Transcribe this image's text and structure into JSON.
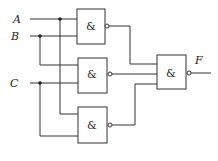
{
  "diagram": {
    "type": "logic-circuit",
    "inputs": [
      {
        "label": "A"
      },
      {
        "label": "B"
      },
      {
        "label": "C"
      }
    ],
    "output": {
      "label": "F"
    },
    "gates": [
      {
        "id": "g1",
        "symbol": "&",
        "type": "NAND",
        "inputs": [
          "A",
          "B"
        ]
      },
      {
        "id": "g2",
        "symbol": "&",
        "type": "NAND",
        "inputs": [
          "B",
          "C"
        ]
      },
      {
        "id": "g3",
        "symbol": "&",
        "type": "NAND",
        "inputs": [
          "A",
          "C"
        ]
      },
      {
        "id": "g4",
        "symbol": "&",
        "type": "NAND",
        "inputs": [
          "g1",
          "g2",
          "g3"
        ],
        "output": "F"
      }
    ]
  }
}
